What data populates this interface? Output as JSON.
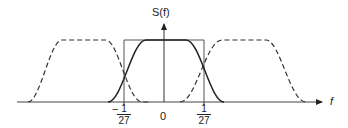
{
  "figure": {
    "y_axis_label": "S(f)",
    "x_axis_label": "f",
    "ticks": {
      "left": {
        "sign": "−",
        "numerator": "1",
        "denominator": "27"
      },
      "center": "0",
      "right": {
        "numerator": "1",
        "denominator": "27"
      }
    },
    "curves": [
      {
        "name": "raised-cosine-main",
        "style": "solid"
      },
      {
        "name": "shifted-spectrum-left",
        "style": "dashed"
      },
      {
        "name": "shifted-spectrum-right",
        "style": "dashed"
      },
      {
        "name": "ideal-rectangle",
        "style": "solid-thin"
      }
    ]
  }
}
